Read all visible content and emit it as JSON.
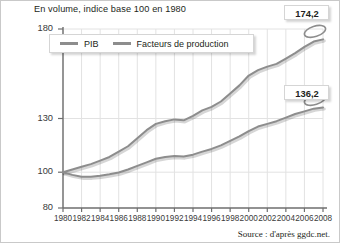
{
  "chart_data": {
    "type": "line",
    "title": "En volume, indice base 100 en 1980",
    "xlabel": "",
    "ylabel": "",
    "source": "Source : d'après ggdc.net.",
    "grid": true,
    "legend_position": "top-left-inside",
    "xlim": [
      1980,
      2008
    ],
    "ylim": [
      80,
      180
    ],
    "yticks": [
      80,
      100,
      130,
      180
    ],
    "ytick_labels": [
      "80",
      "100",
      "130",
      "180"
    ],
    "xticks": [
      1980,
      1982,
      1984,
      1986,
      1988,
      1990,
      1992,
      1994,
      1996,
      1998,
      2000,
      2002,
      2004,
      2006,
      2008
    ],
    "xtick_labels": [
      "1980",
      "1982",
      "1984",
      "1986",
      "1988",
      "1990",
      "1992",
      "1994",
      "1996",
      "1998",
      "2000",
      "2002",
      "2004",
      "2006",
      "2008"
    ],
    "series": [
      {
        "name": "PIB",
        "color": "#8d8d8d",
        "end_label": "174,2",
        "x": [
          1980,
          1981,
          1982,
          1983,
          1984,
          1985,
          1986,
          1987,
          1988,
          1989,
          1990,
          1991,
          1992,
          1993,
          1994,
          1995,
          1996,
          1997,
          1998,
          1999,
          2000,
          2001,
          2002,
          2003,
          2004,
          2005,
          2006,
          2007,
          2008
        ],
        "values": [
          100.0,
          101.5,
          103.0,
          104.5,
          106.5,
          108.5,
          111.5,
          114.5,
          119.0,
          123.5,
          127.0,
          128.5,
          129.5,
          129.0,
          131.5,
          134.5,
          136.5,
          139.5,
          144.0,
          148.5,
          154.0,
          157.0,
          159.0,
          160.5,
          163.5,
          166.5,
          170.0,
          173.0,
          174.2
        ]
      },
      {
        "name": "Facteurs de production",
        "color": "#8d8d8d",
        "end_label": "136,2",
        "x": [
          1980,
          1981,
          1982,
          1983,
          1984,
          1985,
          1986,
          1987,
          1988,
          1989,
          1990,
          1991,
          1992,
          1993,
          1994,
          1995,
          1996,
          1997,
          1998,
          1999,
          2000,
          2001,
          2002,
          2003,
          2004,
          2005,
          2006,
          2007,
          2008
        ],
        "values": [
          100.0,
          98.5,
          97.5,
          97.5,
          98.0,
          98.8,
          99.8,
          101.5,
          103.5,
          105.5,
          107.5,
          108.5,
          109.0,
          108.8,
          109.8,
          111.5,
          113.0,
          115.0,
          117.5,
          120.0,
          123.0,
          125.5,
          127.0,
          128.5,
          130.5,
          132.5,
          134.0,
          135.5,
          136.2
        ]
      }
    ],
    "annotations": [
      {
        "name": "pib-end-callout",
        "text": "174,2"
      },
      {
        "name": "facteurs-end-callout",
        "text": "136,2"
      }
    ]
  },
  "legend": {
    "items": [
      {
        "label": "PIB"
      },
      {
        "label": "Facteurs de production"
      }
    ]
  }
}
